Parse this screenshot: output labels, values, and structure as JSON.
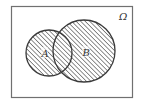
{
  "diagram": {
    "type": "venn",
    "universe_label": "Ω",
    "sets": [
      {
        "id": "A",
        "label": "A",
        "shaded": true
      },
      {
        "id": "B",
        "label": "B",
        "shaded": true
      }
    ],
    "shaded_region": "A ∪ B",
    "colors": {
      "stroke": "#3a3a3a",
      "hatch": "#555555",
      "background": "#ffffff",
      "frame": "#707070"
    }
  }
}
